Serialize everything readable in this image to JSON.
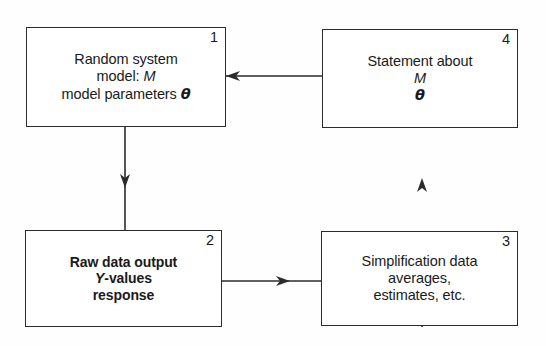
{
  "diagram": {
    "background_color": "#fefefe",
    "line_color": "#2b2b2b",
    "nodes": [
      {
        "number": "1",
        "lines": [
          "Random system",
          "model: M",
          "model parameters θ"
        ],
        "line1": "Random system",
        "line2_prefix": "model: ",
        "line2_italic": "M",
        "line3_prefix": "model parameters ",
        "line3_theta": "θ",
        "bold": false
      },
      {
        "number": "2",
        "lines": [
          "Raw data output",
          "Y-values",
          "response"
        ],
        "line1": "Raw data output",
        "line2_italic": "Y",
        "line2_suffix": "-values",
        "line3": "response",
        "bold": true
      },
      {
        "number": "3",
        "lines": [
          "Simplification data",
          "averages,",
          "estimates, etc."
        ],
        "line1": "Simplification data",
        "line2": "averages,",
        "line3": "estimates, etc.",
        "bold": false
      },
      {
        "number": "4",
        "lines": [
          "Statement about",
          "M",
          "θ"
        ],
        "line1": "Statement about",
        "line2_italic": "M",
        "line3_theta": "θ",
        "bold": false
      }
    ],
    "edges": [
      {
        "name": "edge-4-to-1",
        "from": "4",
        "to": "1",
        "direction": "left"
      },
      {
        "name": "edge-1-to-2",
        "from": "1",
        "to": "2",
        "direction": "down"
      },
      {
        "name": "edge-2-to-3",
        "from": "2",
        "to": "3",
        "direction": "right"
      },
      {
        "name": "edge-3-to-4",
        "from": "3",
        "to": "4",
        "direction": "up"
      }
    ]
  }
}
